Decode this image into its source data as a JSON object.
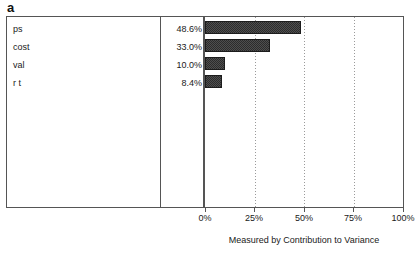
{
  "panel": {
    "label": "a"
  },
  "chart_data": {
    "type": "bar",
    "orientation": "horizontal",
    "title": "",
    "xlabel": "Measured by Contribution to Variance",
    "ylabel": "",
    "xlim": [
      0,
      100
    ],
    "xticks": [
      "0%",
      "25%",
      "50%",
      "75%",
      "100%"
    ],
    "xtick_values": [
      0,
      25,
      50,
      75,
      100
    ],
    "grid": "dotted vertical gridlines at 25%, 50%, 75%",
    "legend": "none",
    "categories": [
      "ps",
      "cost",
      "val",
      "r t"
    ],
    "values": [
      48.6,
      33.0,
      10.0,
      8.4
    ],
    "value_labels": [
      "48.6%",
      "33.0%",
      "10.0%",
      "8.4%"
    ],
    "bar_color": "#2c2c2c",
    "rows": [
      {
        "label": "ps",
        "value": 48.6,
        "value_label": "48.6%"
      },
      {
        "label": "cost",
        "value": 33.0,
        "value_label": "33.0%"
      },
      {
        "label": "val",
        "value": 10.0,
        "value_label": "10.0%"
      },
      {
        "label": "r t",
        "value": 8.4,
        "value_label": "8.4%"
      }
    ]
  }
}
